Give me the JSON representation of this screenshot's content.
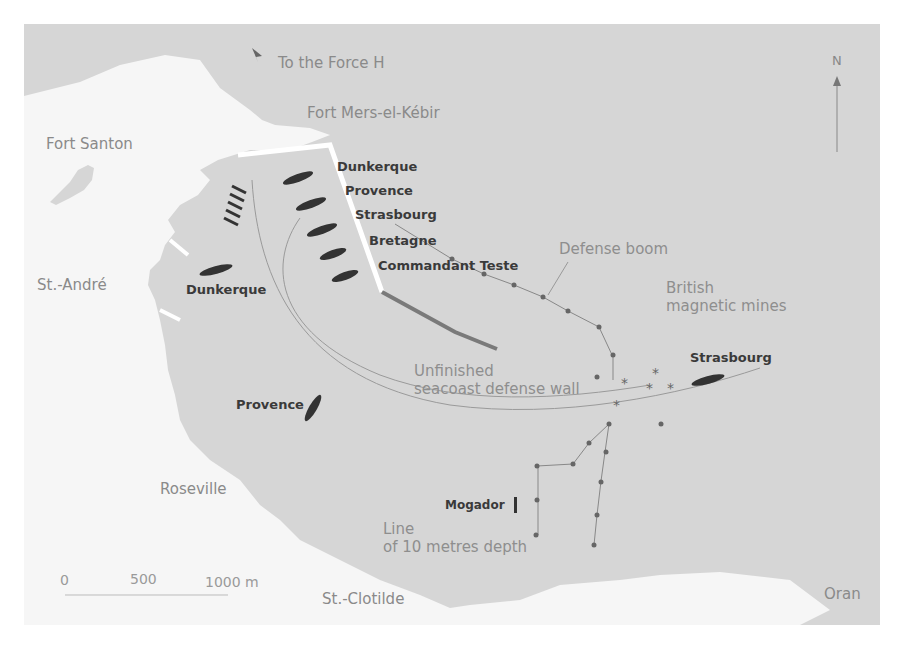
{
  "map": {
    "colors": {
      "sea": "#d6d6d6",
      "land": "#f6f6f6",
      "ship": "#333333",
      "route": "#9a9a9a",
      "boom": "#777777",
      "wall": "#7a7a7a",
      "pier": "#ffffff"
    },
    "places": {
      "force_h": "To the Force H",
      "mers_el_kebir": "Fort Mers-el-Kébir",
      "fort_santon": "Fort Santon",
      "st_andre": "St.-André",
      "roseville": "Roseville",
      "st_clotilde": "St.-Clotilde",
      "oran": "Oran"
    },
    "ships_moored": [
      "Dunkerque",
      "Provence",
      "Strasbourg",
      "Bretagne",
      "Commandant Teste"
    ],
    "ships_positions": {
      "dunkerque": "Dunkerque",
      "provence": "Provence",
      "strasbourg": "Strasbourg",
      "mogador": "Mogador"
    },
    "annotations": {
      "defense_boom": "Defense boom",
      "british_mines": "British\nmagnetic mines",
      "wall": "Unfinished\nseacoast defense wall",
      "depth_line": "Line\nof 10 metres depth"
    },
    "scale": {
      "labels": [
        "0",
        "500",
        "1000 m"
      ]
    },
    "compass": {
      "label": "N"
    }
  }
}
